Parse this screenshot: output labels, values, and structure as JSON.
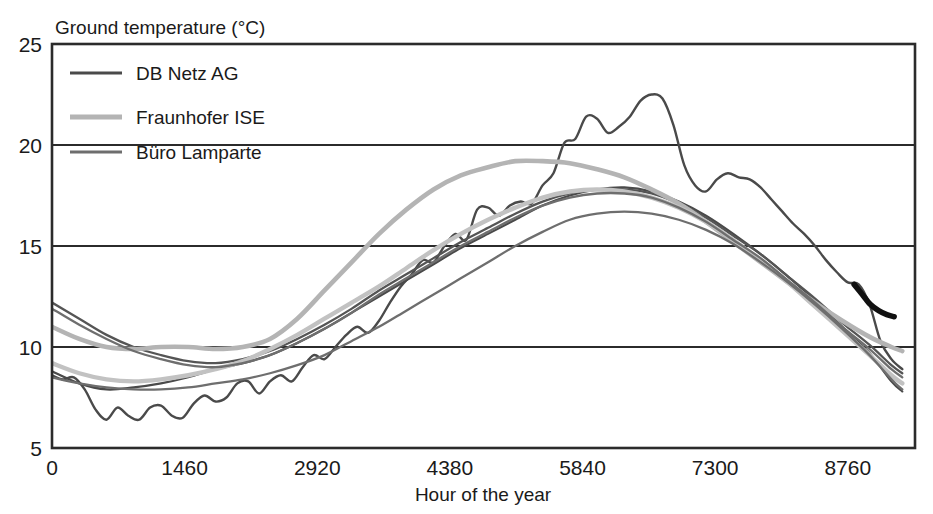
{
  "chart_data": {
    "type": "line",
    "title": "Ground temperature (°C)",
    "xlabel": "Hour of the year",
    "ylabel": "Ground temperature (°C)",
    "xlim": [
      0,
      9500
    ],
    "ylim": [
      5,
      25
    ],
    "xticks": [
      0,
      1460,
      2920,
      4380,
      5840,
      7300,
      8760
    ],
    "xtick_labels": [
      "0",
      "1460",
      "2920",
      "4380",
      "5840",
      "7300",
      "8760"
    ],
    "yticks": [
      5,
      10,
      15,
      20,
      25
    ],
    "ytick_labels": [
      "5",
      "10",
      "15",
      "20",
      "25"
    ],
    "gridlines_y": [
      10,
      15,
      20
    ],
    "grid": "horizontal",
    "legend_position": "top-left",
    "legend": [
      {
        "label": "DB Netz AG",
        "color": "#4a4a4a"
      },
      {
        "label": "Fraunhofer ISE",
        "color": "#b4b4b4"
      },
      {
        "label": "Büro Lamparte",
        "color": "#6e6e6e"
      }
    ],
    "series": [
      {
        "name": "DB Netz AG measured (hourly, noisy)",
        "group": "DB Netz AG",
        "color": "#4a4a4a",
        "width": 2.4,
        "x": [
          0,
          120,
          240,
          360,
          480,
          600,
          720,
          840,
          960,
          1080,
          1200,
          1320,
          1440,
          1560,
          1680,
          1800,
          1920,
          2040,
          2160,
          2280,
          2400,
          2520,
          2640,
          2760,
          2880,
          3000,
          3120,
          3240,
          3360,
          3480,
          3600,
          3720,
          3840,
          3960,
          4080,
          4200,
          4320,
          4440,
          4560,
          4680,
          4800,
          4920,
          5040,
          5160,
          5280,
          5400,
          5520,
          5640,
          5760,
          5880,
          6000,
          6120,
          6240,
          6360,
          6480,
          6600,
          6720,
          6840,
          6960,
          7080,
          7200,
          7320,
          7440,
          7560,
          7680,
          7800,
          7920,
          8040,
          8160,
          8280,
          8400,
          8520,
          8640,
          8760,
          8880,
          9000,
          9120,
          9240,
          9360
        ],
        "y": [
          8.6,
          8.4,
          8.5,
          7.9,
          6.9,
          6.4,
          7.0,
          6.6,
          6.4,
          7.0,
          7.1,
          6.6,
          6.5,
          7.2,
          7.6,
          7.3,
          7.5,
          8.2,
          8.3,
          7.7,
          8.3,
          8.6,
          8.3,
          9.0,
          9.6,
          9.4,
          10.0,
          10.6,
          11.0,
          10.7,
          11.3,
          12.2,
          13.0,
          13.6,
          14.3,
          14.2,
          15.0,
          15.6,
          15.3,
          16.8,
          16.9,
          16.5,
          17.0,
          17.2,
          17.1,
          18.0,
          18.6,
          20.1,
          20.3,
          21.4,
          21.3,
          20.6,
          20.9,
          21.4,
          22.2,
          22.5,
          22.3,
          21.0,
          19.0,
          18.0,
          17.7,
          18.3,
          18.6,
          18.4,
          18.3,
          17.9,
          17.3,
          16.7,
          16.1,
          15.6,
          15.0,
          14.3,
          13.7,
          13.2,
          13.1,
          12.1,
          10.3,
          9.4,
          8.9
        ]
      },
      {
        "name": "DB Netz AG second (lower, noisy)",
        "group": "DB Netz AG",
        "color": "#4a4a4a",
        "width": 2.2,
        "x": [
          0,
          300,
          600,
          900,
          1200,
          1500,
          1800,
          2100,
          2400,
          2700,
          3000,
          3300,
          3600,
          3900,
          4200,
          4500,
          4800,
          5100,
          5400,
          5700,
          6000,
          6300,
          6600,
          6900,
          7200,
          7500,
          7800,
          8100,
          8400,
          8700,
          9000,
          9240,
          9360
        ],
        "y": [
          8.8,
          8.2,
          7.9,
          8.0,
          8.2,
          8.5,
          8.9,
          9.2,
          9.6,
          10.2,
          10.9,
          11.7,
          12.5,
          13.3,
          14.1,
          14.9,
          15.6,
          16.3,
          17.0,
          17.5,
          17.8,
          17.9,
          17.7,
          17.2,
          16.5,
          15.6,
          14.6,
          13.5,
          12.3,
          11.0,
          9.7,
          8.3,
          7.8
        ]
      },
      {
        "name": "DB Netz AG third (smooth, upper start)",
        "group": "DB Netz AG",
        "color": "#555555",
        "width": 2.3,
        "x": [
          0,
          300,
          600,
          900,
          1200,
          1500,
          1800,
          2100,
          2400,
          2700,
          3000,
          3300,
          3600,
          3900,
          4200,
          4500,
          4800,
          5100,
          5400,
          5700,
          6000,
          6300,
          6600,
          6900,
          7200,
          7500,
          7800,
          8100,
          8400,
          8700,
          9000,
          9240,
          9360
        ],
        "y": [
          12.2,
          11.4,
          10.6,
          10.0,
          9.6,
          9.3,
          9.2,
          9.4,
          9.8,
          10.4,
          11.1,
          11.9,
          12.8,
          13.6,
          14.4,
          15.2,
          15.9,
          16.6,
          17.2,
          17.6,
          17.8,
          17.8,
          17.6,
          17.1,
          16.4,
          15.5,
          14.6,
          13.5,
          12.4,
          11.2,
          10.1,
          9.1,
          8.7
        ]
      },
      {
        "name": "Fraunhofer ISE upper (smooth, broad summer plateau)",
        "group": "Fraunhofer ISE",
        "color": "#b4b4b4",
        "width": 4.6,
        "x": [
          0,
          300,
          600,
          900,
          1200,
          1500,
          1800,
          2100,
          2400,
          2700,
          3000,
          3300,
          3600,
          3900,
          4200,
          4500,
          4800,
          5100,
          5400,
          5700,
          6000,
          6300,
          6600,
          6900,
          7200,
          7500,
          7800,
          8100,
          8400,
          8700,
          9000,
          9240,
          9360
        ],
        "y": [
          11.0,
          10.4,
          10.0,
          9.9,
          10.0,
          10.0,
          9.9,
          10.0,
          10.4,
          11.4,
          12.8,
          14.2,
          15.6,
          16.8,
          17.8,
          18.5,
          18.9,
          19.2,
          19.2,
          19.1,
          18.8,
          18.4,
          17.8,
          17.1,
          16.2,
          15.2,
          14.2,
          13.2,
          12.2,
          11.3,
          10.5,
          10.0,
          9.8
        ]
      },
      {
        "name": "Fraunhofer ISE lower (smooth)",
        "group": "Fraunhofer ISE",
        "color": "#c2c2c2",
        "width": 4.4,
        "x": [
          0,
          300,
          600,
          900,
          1200,
          1500,
          1800,
          2100,
          2400,
          2700,
          3000,
          3300,
          3600,
          3900,
          4200,
          4500,
          4800,
          5100,
          5400,
          5700,
          6000,
          6300,
          6600,
          6900,
          7200,
          7500,
          7800,
          8100,
          8400,
          8700,
          9000,
          9240,
          9360
        ],
        "y": [
          9.2,
          8.7,
          8.4,
          8.3,
          8.4,
          8.6,
          8.9,
          9.3,
          9.9,
          10.6,
          11.4,
          12.2,
          13.0,
          13.9,
          14.8,
          15.6,
          16.3,
          16.9,
          17.4,
          17.7,
          17.8,
          17.7,
          17.4,
          16.9,
          16.2,
          15.3,
          14.3,
          13.2,
          12.0,
          10.8,
          9.6,
          8.6,
          8.2
        ]
      },
      {
        "name": "Büro Lamparte upper",
        "group": "Büro Lamparte",
        "color": "#6e6e6e",
        "width": 2.3,
        "x": [
          0,
          300,
          600,
          900,
          1200,
          1500,
          1800,
          2100,
          2400,
          2700,
          3000,
          3300,
          3600,
          3900,
          4200,
          4500,
          4800,
          5100,
          5400,
          5700,
          6000,
          6300,
          6600,
          6900,
          7200,
          7500,
          7800,
          8100,
          8400,
          8700,
          9000,
          9240,
          9360
        ],
        "y": [
          11.9,
          11.1,
          10.4,
          9.8,
          9.4,
          9.1,
          9.0,
          9.2,
          9.6,
          10.2,
          10.9,
          11.7,
          12.6,
          13.4,
          14.2,
          15.0,
          15.7,
          16.4,
          17.0,
          17.4,
          17.6,
          17.6,
          17.4,
          16.9,
          16.2,
          15.3,
          14.4,
          13.3,
          12.2,
          11.0,
          9.9,
          8.9,
          8.5
        ]
      },
      {
        "name": "Büro Lamparte lower (late rise, sharper summer peak)",
        "group": "Büro Lamparte",
        "color": "#6e6e6e",
        "width": 2.3,
        "x": [
          0,
          300,
          600,
          900,
          1200,
          1500,
          1800,
          2100,
          2400,
          2700,
          3000,
          3300,
          3600,
          3900,
          4200,
          4500,
          4800,
          5100,
          5400,
          5700,
          6000,
          6300,
          6600,
          6900,
          7200,
          7500,
          7800,
          8100,
          8400,
          8700,
          9000,
          9240,
          9360
        ],
        "y": [
          8.5,
          8.2,
          8.0,
          7.9,
          7.9,
          8.0,
          8.2,
          8.4,
          8.7,
          9.1,
          9.6,
          10.3,
          11.0,
          11.8,
          12.6,
          13.4,
          14.2,
          15.0,
          15.7,
          16.3,
          16.6,
          16.7,
          16.6,
          16.3,
          15.8,
          15.1,
          14.2,
          13.2,
          12.1,
          10.9,
          9.6,
          8.4,
          7.9
        ]
      },
      {
        "name": "Highlighted segment (thick black, year end)",
        "group": "highlight",
        "color": "#111111",
        "width": 5.6,
        "x": [
          8830,
          8920,
          9010,
          9100,
          9190,
          9270
        ],
        "y": [
          13.1,
          12.6,
          12.1,
          11.8,
          11.6,
          11.5
        ]
      }
    ]
  }
}
